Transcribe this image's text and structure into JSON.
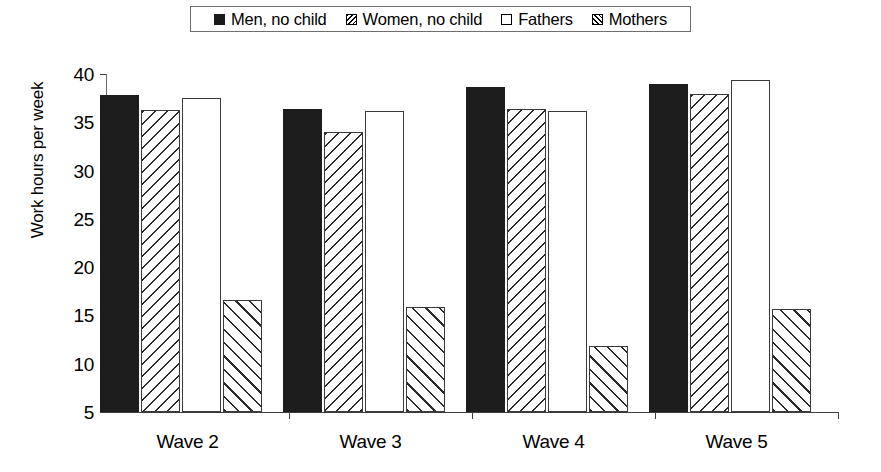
{
  "legend": {
    "position": "top-center",
    "entries": [
      {
        "label": "Men, no child",
        "pattern": "solid-black",
        "name": "legend-men-no-child"
      },
      {
        "label": "Women, no child",
        "pattern": "back-hatch",
        "name": "legend-women-no-child"
      },
      {
        "label": "Fathers",
        "pattern": "white-open",
        "name": "legend-fathers"
      },
      {
        "label": "Mothers",
        "pattern": "fwd-hatch",
        "name": "legend-mothers"
      }
    ]
  },
  "axes": {
    "ylabel": "Work hours per week",
    "yticks": [
      40,
      35,
      30,
      25,
      20,
      15,
      10,
      5
    ],
    "ylim": [
      5,
      40
    ],
    "xlabel": ""
  },
  "chart_data": {
    "type": "bar",
    "title": "",
    "subtitle": "",
    "xlabel": "",
    "ylabel": "Work hours per week",
    "ylim": [
      5,
      40
    ],
    "ytick_step": 5,
    "grid": false,
    "legend_position": "top-center",
    "categories": [
      "Wave 2",
      "Wave 3",
      "Wave 4",
      "Wave 5"
    ],
    "series": [
      {
        "name": "Men, no child",
        "pattern": "solid-black",
        "values": [
          37.8,
          36.4,
          38.7,
          39.0
        ]
      },
      {
        "name": "Women, no child",
        "pattern": "back-hatch",
        "values": [
          36.3,
          34.0,
          36.4,
          37.9
        ]
      },
      {
        "name": "Fathers",
        "pattern": "white-open",
        "values": [
          37.5,
          36.2,
          36.2,
          39.4
        ]
      },
      {
        "name": "Mothers",
        "pattern": "fwd-hatch",
        "values": [
          16.6,
          15.9,
          11.8,
          15.7
        ]
      }
    ]
  },
  "colors": {
    "solid_fill": "#1d1d1d",
    "outline": "#3a3a3a",
    "axis": "#3d3d3d",
    "background": "#ffffff"
  }
}
